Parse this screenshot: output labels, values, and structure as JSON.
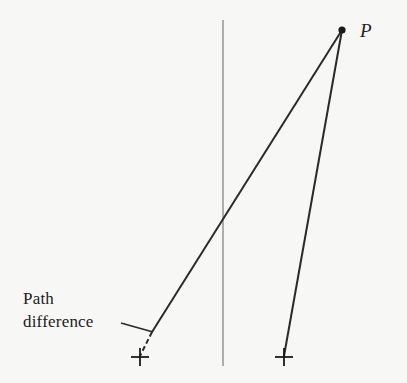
{
  "diagram": {
    "point_label": "P",
    "annotation_line1": "Path",
    "annotation_line2": "difference",
    "colors": {
      "background": "#f7f7f6",
      "ray": "#2a2a2a",
      "screen_line": "#9a9a9a",
      "text": "#222222"
    },
    "elements": {
      "point_P": {
        "x": 342,
        "y": 30
      },
      "screen_line": {
        "x": 223,
        "y1": 20,
        "y2": 366
      },
      "left_source": {
        "x": 140,
        "y": 356
      },
      "right_source": {
        "x": 284,
        "y": 356
      },
      "dashed_segment": {
        "from": [
          152,
          332
        ],
        "to": [
          140,
          356
        ]
      }
    }
  }
}
